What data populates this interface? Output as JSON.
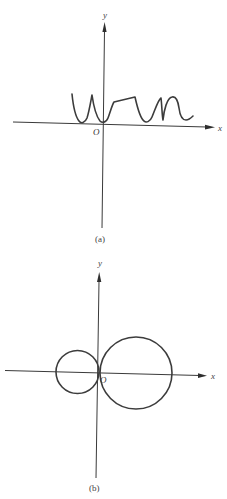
{
  "figures": [
    {
      "id": "a",
      "caption": "(a)",
      "axes": {
        "x_label": "x",
        "y_label": "y",
        "origin_label": "O"
      },
      "description": "Wavy curve lying above the x-axis, touching it at several points including the origin"
    },
    {
      "id": "b",
      "caption": "(b)",
      "axes": {
        "x_label": "x",
        "y_label": "y",
        "origin_label": "O"
      },
      "description": "Two circles tangent at the origin: a smaller circle on the left and a larger circle on the right, both centered on the x-axis"
    }
  ],
  "colors": {
    "line": "#3c3c3c",
    "background": "#ffffff"
  }
}
